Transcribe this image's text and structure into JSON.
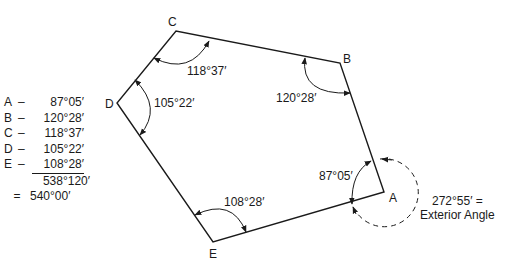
{
  "vertices": [
    {
      "id": "A",
      "x": 384,
      "y": 192,
      "label_x": 389,
      "label_y": 202
    },
    {
      "id": "B",
      "x": 340,
      "y": 63,
      "label_x": 344,
      "label_y": 63
    },
    {
      "id": "C",
      "x": 176,
      "y": 31,
      "label_x": 168,
      "label_y": 25
    },
    {
      "id": "D",
      "x": 117,
      "y": 103,
      "label_x": 105,
      "label_y": 107
    },
    {
      "id": "E",
      "x": 213,
      "y": 242,
      "label_x": 209,
      "label_y": 258
    }
  ],
  "angle_labels": {
    "A": "87°05′",
    "B": "120°28′",
    "C": "118°37′",
    "D": "105°22′",
    "E": "108°28′"
  },
  "exterior": {
    "value": "272°55′ =",
    "caption": "Exterior Angle"
  },
  "tally": {
    "rows": [
      {
        "key": "A",
        "dash": "–",
        "value": "87°05′"
      },
      {
        "key": "B",
        "dash": "–",
        "value": "120°28′"
      },
      {
        "key": "C",
        "dash": "–",
        "value": "118°37′"
      },
      {
        "key": "D",
        "dash": "–",
        "value": "105°22′"
      },
      {
        "key": "E",
        "dash": "–",
        "value": "108°28′"
      }
    ],
    "subtotal": "538°120′",
    "equals": "=",
    "total": "540°00′"
  }
}
